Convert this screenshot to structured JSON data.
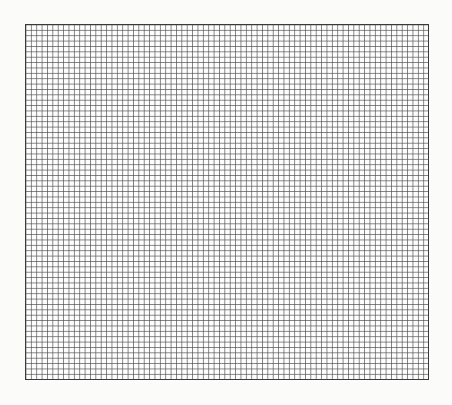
{
  "page": {
    "background_color": "#fbfbfa"
  },
  "grid": {
    "columns": 75,
    "rows": 66,
    "cell_size_px": 5.39,
    "line_color": "#505050",
    "border_color": "#3a3a3a"
  }
}
